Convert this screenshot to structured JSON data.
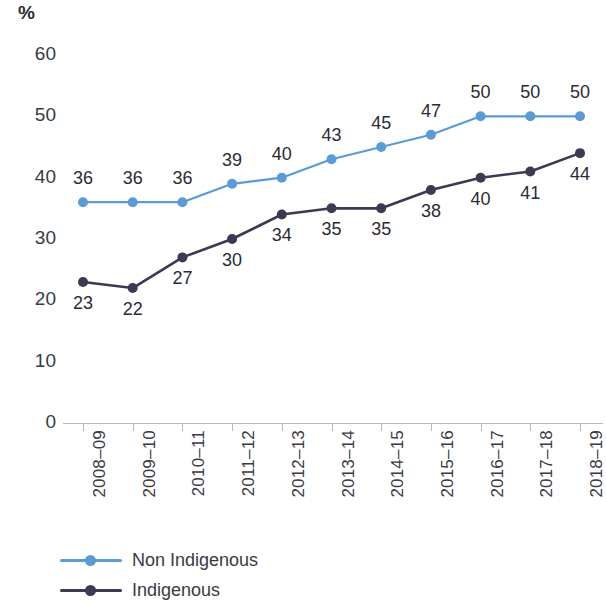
{
  "chart_data": {
    "type": "line",
    "title": "",
    "subtitle": "",
    "xlabel": "",
    "ylabel": "%",
    "ylim": [
      0,
      60
    ],
    "yticks": [
      0,
      10,
      20,
      30,
      40,
      50,
      60
    ],
    "ytick_labels": [
      "0",
      "10",
      "20",
      "30",
      "40",
      "50",
      "60"
    ],
    "grid": false,
    "legend_position": "bottom-left",
    "categories": [
      "2008–09",
      "2009–10",
      "2010–11",
      "2011–12",
      "2012–13",
      "2013–14",
      "2014–15",
      "2015–16",
      "2016–17",
      "2017–18",
      "2018–19"
    ],
    "series": [
      {
        "name": "Non Indigenous",
        "color": "#5b9bd5",
        "values": [
          36,
          36,
          36,
          39,
          40,
          43,
          45,
          47,
          50,
          50,
          50
        ],
        "labels": [
          "36",
          "36",
          "36",
          "39",
          "40",
          "43",
          "45",
          "47",
          "50",
          "50",
          "50"
        ],
        "label_position": "above"
      },
      {
        "name": "Indigenous",
        "color": "#3a3a52",
        "values": [
          23,
          22,
          27,
          30,
          34,
          35,
          35,
          38,
          40,
          41,
          44
        ],
        "labels": [
          "23",
          "22",
          "27",
          "30",
          "34",
          "35",
          "35",
          "38",
          "40",
          "41",
          "44"
        ],
        "label_position": "below"
      }
    ]
  },
  "legend": {
    "items": [
      {
        "label": "Non Indigenous",
        "color": "#5b9bd5"
      },
      {
        "label": "Indigenous",
        "color": "#3a3a52"
      }
    ]
  },
  "axis": {
    "unit_label": "%"
  }
}
